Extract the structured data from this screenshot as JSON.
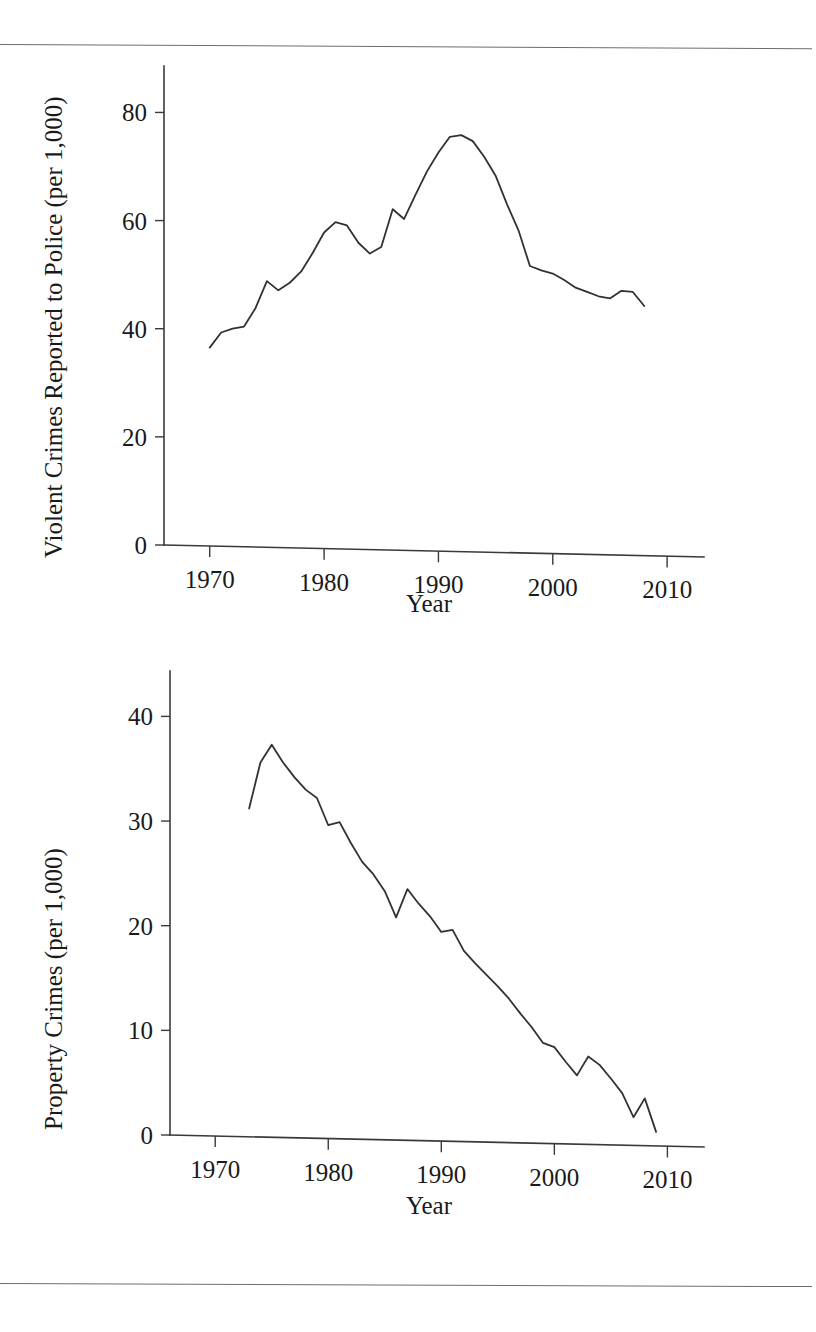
{
  "page": {
    "background_color": "#ffffff",
    "ink_color": "#1a1a1a",
    "line_color": "#33322f",
    "rule_color": "#6d6d6d"
  },
  "figures": [
    {
      "id": "violent-crimes",
      "ylabel": "Violent Crimes Reported to Police (per 1,000)",
      "xlabel": "Year",
      "y_ticks": [
        "0",
        "20",
        "40",
        "60",
        "80"
      ],
      "x_ticks": [
        "1970",
        "1980",
        "1990",
        "2000",
        "2010"
      ]
    },
    {
      "id": "property-crimes",
      "ylabel": "Property Crimes (per 1,000)",
      "xlabel": "Year",
      "y_ticks": [
        "0",
        "10",
        "20",
        "30",
        "40"
      ],
      "x_ticks": [
        "1970",
        "1980",
        "1990",
        "2000",
        "2010"
      ]
    }
  ],
  "chart_data": [
    {
      "type": "line",
      "id": "violent-crimes",
      "title": "",
      "xlabel": "Year",
      "ylabel": "Violent Crimes Reported to Police (per 1,000)",
      "xlim": [
        1966,
        2012
      ],
      "ylim": [
        0,
        86
      ],
      "xticks": [
        1970,
        1980,
        1990,
        2000,
        2010
      ],
      "yticks": [
        0,
        20,
        40,
        60,
        80
      ],
      "grid": false,
      "legend": false,
      "x": [
        1970,
        1971,
        1972,
        1973,
        1974,
        1975,
        1976,
        1977,
        1978,
        1979,
        1980,
        1981,
        1982,
        1983,
        1984,
        1985,
        1986,
        1987,
        1988,
        1989,
        1990,
        1991,
        1992,
        1993,
        1994,
        1995,
        1996,
        1997,
        1998,
        1999,
        2000,
        2001,
        2002,
        2003,
        2004,
        2005,
        2006,
        2007,
        2008
      ],
      "values": [
        36.5,
        39.3,
        40.0,
        40.4,
        43.8,
        48.8,
        47.1,
        48.5,
        50.6,
        54.0,
        57.8,
        59.7,
        59.1,
        55.9,
        53.9,
        55.1,
        62.1,
        60.3,
        64.8,
        69.1,
        72.6,
        75.5,
        75.8,
        74.7,
        71.8,
        68.3,
        63.0,
        58.2,
        51.6,
        50.8,
        50.2,
        49.0,
        47.6,
        46.8,
        46.0,
        45.6,
        47.0,
        46.8,
        44.2
      ]
    },
    {
      "type": "line",
      "id": "property-crimes",
      "title": "",
      "xlabel": "Year",
      "ylabel": "Property Crimes (per 1,000)",
      "xlim": [
        1966,
        2012
      ],
      "ylim": [
        0,
        43
      ],
      "xticks": [
        1970,
        1980,
        1990,
        2000,
        2010
      ],
      "yticks": [
        0,
        10,
        20,
        30,
        40
      ],
      "grid": false,
      "legend": false,
      "x": [
        1973,
        1974,
        1975,
        1976,
        1977,
        1978,
        1979,
        1980,
        1981,
        1982,
        1983,
        1984,
        1985,
        1986,
        1987,
        1988,
        1989,
        1990,
        1991,
        1992,
        1993,
        1994,
        1995,
        1996,
        1997,
        1998,
        1999,
        2000,
        2001,
        2002,
        2003,
        2004,
        2005,
        2006,
        2007,
        2008,
        2009
      ],
      "values": [
        31.2,
        35.6,
        37.3,
        35.6,
        34.2,
        33.0,
        32.2,
        29.6,
        29.9,
        27.9,
        26.1,
        24.9,
        23.3,
        20.8,
        23.5,
        22.1,
        20.9,
        19.4,
        19.6,
        17.6,
        16.4,
        15.3,
        14.2,
        13.0,
        11.6,
        10.3,
        8.8,
        8.4,
        7.0,
        5.7,
        7.5,
        6.7,
        5.4,
        4.0,
        1.7,
        3.5,
        0.3
      ]
    }
  ]
}
